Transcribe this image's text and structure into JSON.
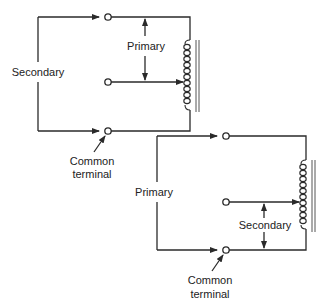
{
  "figure": {
    "diagrams": [
      {
        "id": "top",
        "labels": {
          "left_winding": "Secondary",
          "tap_span": "Primary",
          "common": [
            "Common",
            "terminal"
          ]
        }
      },
      {
        "id": "bottom",
        "labels": {
          "left_winding": "Primary",
          "tap_span": "Secondary",
          "common": [
            "Common",
            "terminal"
          ]
        }
      }
    ],
    "colors": {
      "line": "#2a2a2a",
      "background": "#ffffff"
    }
  }
}
